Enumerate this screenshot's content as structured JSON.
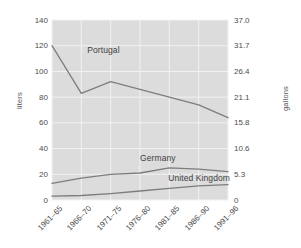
{
  "chart_data": {
    "type": "line",
    "title": "",
    "xlabel": "",
    "ylabel": "liters",
    "ylabel_right": "gallons",
    "grid": true,
    "legend_position": "inline-labels",
    "categories": [
      "1961–65",
      "1966–70",
      "1971–75",
      "1976–80",
      "1981–85",
      "1986–90",
      "1991–96"
    ],
    "ylim": [
      0,
      140
    ],
    "ylim_right": [
      0,
      37.0
    ],
    "yticks": [
      "0",
      "20",
      "40",
      "60",
      "80",
      "100",
      "120",
      "140"
    ],
    "ytick_values": [
      0,
      20,
      40,
      60,
      80,
      100,
      120,
      140
    ],
    "yticks_right": [
      "0",
      "5.3",
      "10.6",
      "15.8",
      "21.1",
      "26.4",
      "31.7",
      "37.0"
    ],
    "ytick_values_right": [
      0,
      5.3,
      10.6,
      15.8,
      21.1,
      26.4,
      31.7,
      37.0
    ],
    "series": [
      {
        "name": "Portugal",
        "values": [
          120,
          83,
          92,
          86,
          80,
          74,
          64
        ],
        "color": "#7d7d7d"
      },
      {
        "name": "Germany",
        "values": [
          13,
          17,
          20,
          21,
          25,
          24,
          22
        ],
        "color": "#7d7d7d"
      },
      {
        "name": "United Kingdom",
        "values": [
          3,
          3.5,
          5,
          7,
          9,
          11,
          12
        ],
        "color": "#7d7d7d"
      }
    ],
    "annotations": [
      {
        "text": "Portugal",
        "x_frac": 0.2,
        "y_value": 117
      },
      {
        "text": "Germany",
        "x_frac": 0.5,
        "y_value": 33
      },
      {
        "text": "United Kingdom",
        "x_frac": 0.66,
        "y_value": 17
      }
    ],
    "colors": {
      "plot_background": "#dcdcdc",
      "gridline": "#f2f2f2",
      "line": "#7d7d7d",
      "tick_text": "#4d4d4d",
      "axis_title": "#555555",
      "page_background": "#ffffff"
    }
  }
}
